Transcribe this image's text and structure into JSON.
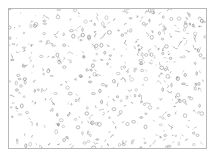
{
  "image": {
    "description": "Edge-detected grayscale texture of scattered small blob outlines on a white background, enclosed in a thin gray border",
    "background_color": "#ffffff",
    "stroke_color": "#8a8a8a",
    "border_color": "#b8b8b8"
  }
}
